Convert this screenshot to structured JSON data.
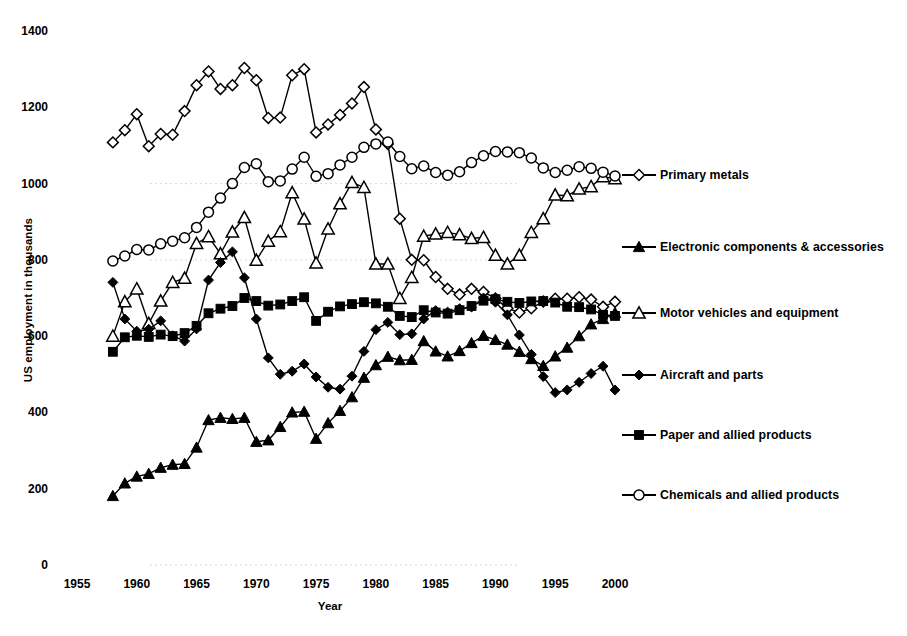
{
  "chart_data": {
    "type": "line",
    "title": "",
    "xlabel": "Year",
    "ylabel": "US employment in thousands",
    "xlim": [
      1955,
      2001
    ],
    "ylim": [
      0,
      1400
    ],
    "xticks": [
      1955,
      1960,
      1965,
      1970,
      1975,
      1980,
      1985,
      1990,
      1995,
      2000
    ],
    "yticks": [
      0,
      200,
      400,
      600,
      800,
      1000,
      1200,
      1400
    ],
    "grid": false,
    "legend_position": "right",
    "x": [
      1958,
      1959,
      1960,
      1961,
      1962,
      1963,
      1964,
      1965,
      1966,
      1967,
      1968,
      1969,
      1970,
      1971,
      1972,
      1973,
      1974,
      1975,
      1976,
      1977,
      1978,
      1979,
      1980,
      1981,
      1982,
      1983,
      1984,
      1985,
      1986,
      1987,
      1988,
      1989,
      1990,
      1991,
      1992,
      1993,
      1994,
      1995,
      1996,
      1997,
      1998,
      1999,
      2000
    ],
    "series": [
      {
        "name": "Primary metals",
        "marker": "open-diamond",
        "values": [
          1108,
          1140,
          1182,
          1098,
          1130,
          1128,
          1190,
          1258,
          1294,
          1248,
          1258,
          1303,
          1271,
          1172,
          1173,
          1284,
          1300,
          1134,
          1155,
          1180,
          1210,
          1253,
          1142,
          1104,
          908,
          800,
          799,
          755,
          724,
          709,
          724,
          716,
          699,
          673,
          662,
          673,
          691,
          698,
          698,
          702,
          696,
          677,
          690
        ]
      },
      {
        "name": "Electronic components & accessories",
        "marker": "filled-triangle",
        "values": [
          181,
          214,
          232,
          239,
          255,
          263,
          265,
          308,
          380,
          386,
          383,
          386,
          323,
          327,
          362,
          400,
          402,
          331,
          372,
          404,
          440,
          491,
          524,
          546,
          537,
          538,
          587,
          560,
          547,
          561,
          582,
          601,
          590,
          578,
          559,
          540,
          522,
          547,
          570,
          600,
          631,
          645,
          661
        ]
      },
      {
        "name": "Motor vehicles and equipment",
        "marker": "open-triangle",
        "values": [
          600,
          690,
          724,
          633,
          692,
          741,
          752,
          843,
          861,
          816,
          873,
          911,
          799,
          849,
          874,
          976,
          907,
          792,
          881,
          947,
          1003,
          990,
          789,
          789,
          699,
          754,
          862,
          868,
          872,
          866,
          856,
          859,
          812,
          789,
          812,
          872,
          908,
          970,
          968,
          986,
          992,
          1018,
          1013
        ]
      },
      {
        "name": "Aircraft and parts",
        "marker": "filled-diamond",
        "values": [
          741,
          645,
          613,
          618,
          640,
          601,
          587,
          619,
          747,
          793,
          821,
          753,
          645,
          543,
          500,
          508,
          527,
          493,
          466,
          461,
          495,
          560,
          617,
          636,
          604,
          606,
          645,
          667,
          663,
          672,
          676,
          700,
          689,
          656,
          603,
          552,
          494,
          452,
          459,
          479,
          502,
          521,
          459
        ]
      },
      {
        "name": "Paper and allied products",
        "marker": "filled-square",
        "values": [
          559,
          597,
          601,
          598,
          604,
          600,
          608,
          627,
          660,
          672,
          679,
          700,
          692,
          680,
          683,
          692,
          702,
          640,
          664,
          678,
          684,
          689,
          686,
          677,
          653,
          650,
          668,
          662,
          659,
          668,
          679,
          693,
          697,
          690,
          687,
          691,
          692,
          688,
          677,
          676,
          670,
          656,
          653
        ]
      },
      {
        "name": "Chemicals and allied products",
        "marker": "open-circle",
        "values": [
          797,
          810,
          827,
          826,
          842,
          849,
          858,
          885,
          925,
          962,
          1000,
          1042,
          1052,
          1005,
          1007,
          1038,
          1069,
          1019,
          1026,
          1049,
          1069,
          1095,
          1104,
          1109,
          1071,
          1039,
          1046,
          1029,
          1022,
          1031,
          1055,
          1073,
          1084,
          1083,
          1081,
          1067,
          1041,
          1029,
          1035,
          1044,
          1040,
          1030,
          1020
        ]
      }
    ]
  },
  "axes": {
    "y_title": "US employment in thousands",
    "x_title": "Year",
    "y_tick_labels": [
      "1400",
      "1200",
      "1000",
      "800",
      "600",
      "400",
      "200",
      "0"
    ],
    "x_tick_labels": [
      "1955",
      "1960",
      "1965",
      "1970",
      "1975",
      "1980",
      "1985",
      "1990",
      "1995",
      "2000"
    ]
  },
  "legend": {
    "items": [
      {
        "label": "Primary metals",
        "marker": "open-diamond"
      },
      {
        "label": "Electronic components & accessories",
        "marker": "filled-triangle"
      },
      {
        "label": "Motor vehicles and equipment",
        "marker": "open-triangle"
      },
      {
        "label": "Aircraft and parts",
        "marker": "filled-diamond"
      },
      {
        "label": "Paper and allied products",
        "marker": "filled-square"
      },
      {
        "label": "Chemicals and allied products",
        "marker": "open-circle"
      }
    ]
  },
  "style": {
    "line_color": "#000000",
    "background": "#ffffff"
  }
}
